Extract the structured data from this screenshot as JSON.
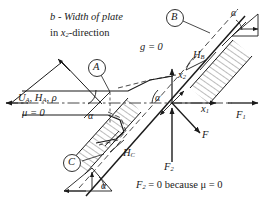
{
  "figure": {
    "title_note": "b - Width of plate",
    "title_note_line2_pre": "in ",
    "title_note_var": "x",
    "title_note_sub": "2",
    "title_note_line2_post": "-direction",
    "gravity_label": "g = 0",
    "bottom_note": "F",
    "bottom_note_sub": "2",
    "bottom_note_rest": " = 0 because  μ = 0"
  },
  "inflow": {
    "props_label": "U",
    "props_sub_a1": "A",
    "props_mid": ", H",
    "props_sub_a2": "A",
    "props_end": ", ρ",
    "viscosity_label": "μ = 0",
    "angle_label": "α"
  },
  "callouts": {
    "a": "A",
    "b": "B",
    "c": "C"
  },
  "thickness": {
    "b_label": "H",
    "b_sub": "B",
    "c_label": "H",
    "c_sub": "C"
  },
  "axes": {
    "x1": "x",
    "x1_sub": "1",
    "x2": "x",
    "x2_sub": "2",
    "origin_angle": "α"
  },
  "forces": {
    "f": "F",
    "f1": "F",
    "f1_sub": "1",
    "f2": "F",
    "f2_sub": "2"
  },
  "angles": {
    "top_right": "α",
    "bottom_left": "α"
  },
  "colors": {
    "ink": "#1a1a1a",
    "paper": "#ffffff",
    "hatch": "#333333"
  }
}
